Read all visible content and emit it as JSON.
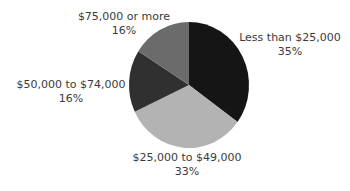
{
  "chart_data": {
    "type": "pie",
    "title": "",
    "categories": [
      "Less than $25,000",
      "$25,000 to $49,000",
      "$50,000 to $74,000",
      "$75,000 or more"
    ],
    "values": [
      35,
      33,
      16,
      16
    ],
    "unit": "%",
    "colors": [
      "#151515",
      "#b3b3b3",
      "#303030",
      "#6b6b6b"
    ],
    "start_angle_deg": 0,
    "direction": "clockwise",
    "legend": "none (direct labels)"
  },
  "labels": [
    {
      "name": "Less than $25,000",
      "pct": "35%"
    },
    {
      "name": "$25,000 to $49,000",
      "pct": "33%"
    },
    {
      "name": "$50,000 to $74,000",
      "pct": "16%"
    },
    {
      "name": "$75,000 or more",
      "pct": "16%"
    }
  ]
}
